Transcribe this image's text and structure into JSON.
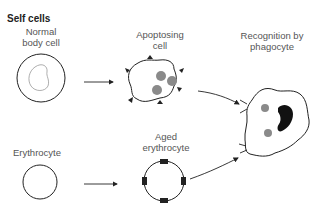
{
  "diagram": {
    "section_title": "Self cells",
    "labels": {
      "normal_cell": [
        "Normal",
        "body cell"
      ],
      "apoptosing_cell": [
        "Apoptosing",
        "cell"
      ],
      "phagocyte": [
        "Recognition by",
        "phagocyte"
      ],
      "erythrocyte": [
        "Erythrocyte"
      ],
      "aged_erythrocyte": [
        "Aged",
        "erythrocyte"
      ]
    },
    "colors": {
      "outline": "#222222",
      "inner_outline": "#999999",
      "particle": "#8a8a8a",
      "nucleus": "#111111",
      "label": "#555555"
    },
    "nodes": [
      {
        "id": "normal-body-cell",
        "label": "Normal body cell"
      },
      {
        "id": "apoptosing-cell",
        "label": "Apoptosing cell"
      },
      {
        "id": "erythrocyte",
        "label": "Erythrocyte"
      },
      {
        "id": "aged-erythrocyte",
        "label": "Aged erythrocyte"
      },
      {
        "id": "phagocyte",
        "label": "Recognition by phagocyte"
      }
    ],
    "edges": [
      {
        "from": "normal-body-cell",
        "to": "apoptosing-cell"
      },
      {
        "from": "erythrocyte",
        "to": "aged-erythrocyte"
      },
      {
        "from": "apoptosing-cell",
        "to": "phagocyte"
      },
      {
        "from": "aged-erythrocyte",
        "to": "phagocyte"
      }
    ]
  }
}
